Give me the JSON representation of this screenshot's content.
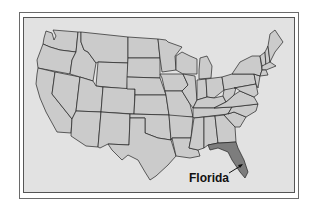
{
  "map": {
    "title": "United States",
    "highlighted_state": "Florida",
    "label": "Florida",
    "colors": {
      "frame_background": "#e2e2e2",
      "state_fill": "#cbcbcb",
      "highlight_fill": "#7d7d7d",
      "border": "#222222"
    }
  }
}
